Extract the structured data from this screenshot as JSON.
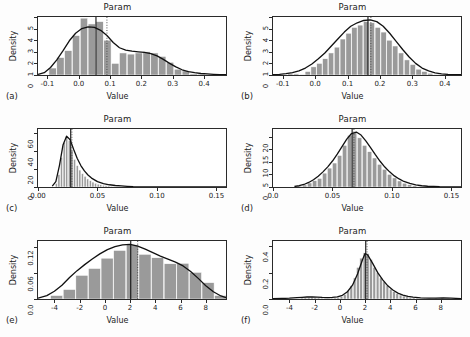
{
  "figure": {
    "axis_label_x": "Value",
    "axis_label_y": "Density",
    "title": "Param",
    "background": "#fdfdfd",
    "bar_fill": "#9a9a9a",
    "bar_edge": "#ffffff",
    "curve_color": "#111111",
    "rug_color": "#8a8a8a"
  },
  "chart_data": [
    {
      "type": "bar",
      "panel": "(a)",
      "title": "Param",
      "xlabel": "Value",
      "ylabel": "Density",
      "xlim": [
        -0.13,
        0.47
      ],
      "ylim": [
        0,
        5
      ],
      "xticks": [
        -0.1,
        0.0,
        0.1,
        0.2,
        0.3,
        0.4
      ],
      "xticklabels": [
        "-0.1",
        "0.0",
        "0.1",
        "0.2",
        "0.3",
        "0.4"
      ],
      "yticks": [
        0,
        1,
        2,
        3,
        4,
        5
      ],
      "yticklabels": [
        "0",
        "1",
        "2",
        "3",
        "4",
        "5"
      ],
      "bin_width": 0.025,
      "bin_starts": [
        -0.095,
        -0.07,
        -0.045,
        -0.02,
        0.005,
        0.03,
        0.055,
        0.08,
        0.105,
        0.13,
        0.155,
        0.18,
        0.205,
        0.23,
        0.255,
        0.28,
        0.305,
        0.33,
        0.355,
        0.38,
        0.405,
        0.43
      ],
      "values": [
        0.6,
        1.5,
        2.1,
        3.4,
        4.9,
        4.4,
        4.6,
        3.0,
        1.0,
        1.9,
        1.8,
        1.9,
        2.0,
        1.9,
        1.6,
        1.1,
        0.5,
        0.35,
        0.1,
        0.08,
        0.05,
        0.03
      ],
      "curve_x": [
        -0.13,
        -0.11,
        -0.09,
        -0.07,
        -0.05,
        -0.03,
        -0.01,
        0.01,
        0.03,
        0.05,
        0.07,
        0.09,
        0.11,
        0.13,
        0.15,
        0.17,
        0.19,
        0.21,
        0.23,
        0.25,
        0.27,
        0.29,
        0.31,
        0.33,
        0.35,
        0.37,
        0.39,
        0.41,
        0.43,
        0.45,
        0.47
      ],
      "curve_y": [
        0.05,
        0.2,
        0.65,
        1.3,
        2.1,
        2.95,
        3.6,
        4.0,
        4.15,
        4.1,
        3.85,
        3.4,
        2.8,
        2.35,
        2.15,
        2.05,
        2.0,
        1.95,
        1.85,
        1.65,
        1.35,
        1.0,
        0.7,
        0.45,
        0.3,
        0.2,
        0.13,
        0.09,
        0.06,
        0.04,
        0.03
      ],
      "median_line": 0.055,
      "mean_line": 0.09,
      "grid": false,
      "legend": "none"
    },
    {
      "type": "bar",
      "panel": "(b)",
      "title": "Param",
      "xlabel": "Value",
      "ylabel": "Density",
      "xlim": [
        -0.13,
        0.45
      ],
      "ylim": [
        0,
        5
      ],
      "xticks": [
        -0.1,
        0.0,
        0.1,
        0.2,
        0.3,
        0.4
      ],
      "xticklabels": [
        "-0.1",
        "0.0",
        "0.1",
        "0.2",
        "0.3",
        "0.4"
      ],
      "yticks": [
        0,
        1,
        2,
        3,
        4,
        5
      ],
      "yticklabels": [
        "0",
        "1",
        "2",
        "3",
        "4",
        "5"
      ],
      "bin_width": 0.018,
      "bin_starts": [
        -0.085,
        -0.067,
        -0.049,
        -0.031,
        -0.013,
        0.005,
        0.023,
        0.041,
        0.059,
        0.077,
        0.095,
        0.113,
        0.131,
        0.149,
        0.167,
        0.185,
        0.203,
        0.221,
        0.239,
        0.257,
        0.275,
        0.293,
        0.311,
        0.329,
        0.347,
        0.365
      ],
      "values": [
        0.15,
        0.1,
        0.05,
        0.3,
        0.7,
        1.0,
        1.4,
        1.9,
        2.4,
        3.1,
        3.6,
        4.1,
        4.3,
        4.6,
        4.5,
        4.1,
        3.7,
        3.0,
        2.5,
        1.9,
        1.3,
        0.9,
        0.5,
        0.3,
        0.15,
        0.05
      ],
      "curve_x": [
        -0.13,
        -0.11,
        -0.09,
        -0.07,
        -0.05,
        -0.03,
        -0.01,
        0.01,
        0.03,
        0.05,
        0.07,
        0.09,
        0.11,
        0.13,
        0.15,
        0.17,
        0.19,
        0.21,
        0.23,
        0.25,
        0.27,
        0.29,
        0.31,
        0.33,
        0.35,
        0.37,
        0.39,
        0.41,
        0.43,
        0.45
      ],
      "curve_y": [
        0.03,
        0.06,
        0.12,
        0.2,
        0.35,
        0.6,
        0.95,
        1.4,
        1.9,
        2.5,
        3.1,
        3.7,
        4.2,
        4.5,
        4.7,
        4.75,
        4.6,
        4.2,
        3.6,
        2.9,
        2.2,
        1.55,
        1.0,
        0.6,
        0.35,
        0.18,
        0.1,
        0.05,
        0.03,
        0.02
      ],
      "median_line": 0.163,
      "mean_line": 0.172,
      "grid": false,
      "legend": "none"
    },
    {
      "type": "bar",
      "panel": "(c)",
      "title": "Param",
      "xlabel": "Value",
      "ylabel": "Density",
      "xlim": [
        0.0,
        0.158
      ],
      "ylim": [
        0,
        65
      ],
      "xticks": [
        0.0,
        0.05,
        0.1,
        0.15
      ],
      "xticklabels": [
        "0.00",
        "0.05",
        "0.10",
        "0.15"
      ],
      "yticks": [
        0,
        20,
        40,
        60
      ],
      "yticklabels": [
        "0",
        "20",
        "40",
        "60"
      ],
      "bin_width": 0.0022,
      "bin_starts": [
        0.0145,
        0.0167,
        0.0189,
        0.0211,
        0.0233,
        0.0255,
        0.0277,
        0.0299,
        0.0321,
        0.0343,
        0.0365,
        0.0387,
        0.0409,
        0.0431,
        0.0453,
        0.0475,
        0.0497,
        0.0519,
        0.0541,
        0.0563,
        0.0585,
        0.0607,
        0.0629,
        0.0651,
        0.0673,
        0.0695,
        0.0717
      ],
      "values": [
        4,
        14,
        33,
        50,
        57,
        52,
        41,
        31,
        24,
        19,
        15,
        12,
        9,
        7,
        5.5,
        4.2,
        3.2,
        2.5,
        2,
        1.6,
        1.2,
        0.9,
        0.7,
        0.5,
        0.4,
        0.3,
        0.2
      ],
      "curve_x": [
        0.012,
        0.015,
        0.018,
        0.021,
        0.024,
        0.027,
        0.03,
        0.033,
        0.036,
        0.039,
        0.042,
        0.045,
        0.05,
        0.055,
        0.06,
        0.065,
        0.07,
        0.075,
        0.08,
        0.09,
        0.1,
        0.12,
        0.14,
        0.158
      ],
      "curve_y": [
        1,
        6,
        24,
        47,
        57,
        53,
        42,
        32,
        24,
        18,
        13.5,
        10,
        6,
        3.8,
        2.5,
        1.7,
        1.2,
        0.8,
        0.5,
        0.25,
        0.12,
        0.04,
        0.02,
        0.01
      ],
      "median_line": 0.0275,
      "mean_line": 0.0285,
      "grid": false,
      "legend": "none"
    },
    {
      "type": "bar",
      "panel": "(d)",
      "title": "Param",
      "xlabel": "Value",
      "ylabel": "Density",
      "xlim": [
        0.0,
        0.158
      ],
      "ylim": [
        0,
        23
      ],
      "xticks": [
        0.0,
        0.05,
        0.1,
        0.15
      ],
      "xticklabels": [
        "0.0",
        "0.05",
        "0.10",
        "0.15"
      ],
      "yticks": [
        0,
        5,
        10,
        15,
        20
      ],
      "yticklabels": [
        "0",
        "5",
        "10",
        "15",
        "20"
      ],
      "bin_width": 0.0042,
      "bin_starts": [
        0.0205,
        0.0247,
        0.0289,
        0.0331,
        0.0373,
        0.0415,
        0.0457,
        0.0499,
        0.0541,
        0.0583,
        0.0625,
        0.0667,
        0.0709,
        0.0751,
        0.0793,
        0.0835,
        0.0877,
        0.0919,
        0.0961,
        0.1003,
        0.1045,
        0.1087,
        0.1129,
        0.1171,
        0.1213,
        0.1255
      ],
      "values": [
        0.4,
        0.8,
        1.6,
        2.5,
        3.4,
        5.5,
        7.5,
        9.5,
        12.5,
        16.5,
        20.5,
        21.5,
        19.5,
        16.5,
        14.0,
        11.5,
        9.0,
        7.0,
        5.0,
        3.6,
        2.4,
        1.5,
        0.9,
        0.5,
        0.3,
        0.15
      ],
      "curve_x": [
        0.018,
        0.022,
        0.026,
        0.03,
        0.034,
        0.038,
        0.042,
        0.046,
        0.05,
        0.054,
        0.058,
        0.062,
        0.066,
        0.07,
        0.074,
        0.078,
        0.082,
        0.086,
        0.09,
        0.094,
        0.098,
        0.102,
        0.106,
        0.11,
        0.115,
        0.12,
        0.125,
        0.13,
        0.14,
        0.158
      ],
      "curve_y": [
        0.2,
        0.5,
        1.0,
        1.8,
        2.9,
        4.3,
        6.0,
        8.0,
        10.3,
        13.0,
        16.0,
        19.0,
        21.2,
        21.8,
        20.6,
        18.3,
        15.6,
        12.8,
        10.2,
        7.9,
        6.0,
        4.4,
        3.2,
        2.2,
        1.4,
        0.85,
        0.5,
        0.3,
        0.12,
        0.04
      ],
      "median_line": 0.0665,
      "mean_line": 0.068,
      "grid": false,
      "legend": "none"
    },
    {
      "type": "bar",
      "panel": "(e)",
      "title": "Param",
      "xlabel": "Value",
      "ylabel": "Density",
      "xlim": [
        -5.3,
        9.6
      ],
      "ylim": [
        0,
        0.135
      ],
      "xticks": [
        -4,
        -2,
        0,
        2,
        4,
        6,
        8
      ],
      "xticklabels": [
        "-4",
        "-2",
        "0",
        "2",
        "4",
        "6",
        "8"
      ],
      "yticks": [
        0.0,
        0.06,
        0.12
      ],
      "yticklabels": [
        "0.0",
        "0.06",
        "0.12"
      ],
      "bin_width": 1.0,
      "bin_starts": [
        -4.3,
        -3.3,
        -2.3,
        -1.3,
        -0.3,
        0.7,
        1.7,
        2.7,
        3.7,
        4.7,
        5.7,
        6.7,
        7.7,
        8.7
      ],
      "values": [
        0.008,
        0.022,
        0.055,
        0.071,
        0.095,
        0.113,
        0.126,
        0.104,
        0.096,
        0.082,
        0.083,
        0.062,
        0.038,
        0.008
      ],
      "curve_x": [
        -5.3,
        -4.6,
        -4.0,
        -3.4,
        -2.8,
        -2.2,
        -1.6,
        -1.0,
        -0.4,
        0.2,
        0.8,
        1.4,
        2.0,
        2.6,
        3.2,
        3.8,
        4.4,
        5.0,
        5.6,
        6.2,
        6.8,
        7.4,
        8.0,
        8.6,
        9.2,
        9.6
      ],
      "curve_y": [
        0.002,
        0.008,
        0.018,
        0.032,
        0.05,
        0.066,
        0.08,
        0.093,
        0.105,
        0.115,
        0.122,
        0.126,
        0.127,
        0.123,
        0.116,
        0.108,
        0.1,
        0.093,
        0.086,
        0.077,
        0.064,
        0.048,
        0.031,
        0.017,
        0.007,
        0.003
      ],
      "median_line": 2.05,
      "mean_line": 2.6,
      "grid": false,
      "legend": "none"
    },
    {
      "type": "bar",
      "panel": "(f)",
      "title": "Param",
      "xlabel": "Value",
      "ylabel": "Density",
      "xlim": [
        -5.3,
        9.6
      ],
      "ylim": [
        0,
        0.44
      ],
      "xticks": [
        -4,
        -2,
        0,
        2,
        4,
        6,
        8
      ],
      "xticklabels": [
        "-4",
        "-2",
        "0",
        "2",
        "4",
        "6",
        "8"
      ],
      "yticks": [
        0.0,
        0.2,
        0.4
      ],
      "yticklabels": [
        "0.0",
        "0.2",
        "0.4"
      ],
      "bin_width": 0.26,
      "bin_starts": [
        -3.1,
        -2.84,
        -2.58,
        -2.32,
        -2.06,
        -1.8,
        -1.54,
        -1.28,
        -1.02,
        -0.76,
        -0.5,
        -0.24,
        0.02,
        0.28,
        0.54,
        0.8,
        1.06,
        1.32,
        1.58,
        1.84,
        2.1,
        2.36,
        2.62,
        2.88,
        3.14,
        3.4,
        3.66,
        3.92,
        4.18,
        4.44,
        4.7,
        4.96,
        5.22,
        5.48,
        5.74,
        6.0,
        6.5,
        7.0,
        7.5,
        8.0,
        8.5
      ],
      "values": [
        0.008,
        0.01,
        0.012,
        0.014,
        0.012,
        0.009,
        0.007,
        0.006,
        0.006,
        0.007,
        0.008,
        0.012,
        0.02,
        0.035,
        0.06,
        0.1,
        0.16,
        0.24,
        0.31,
        0.35,
        0.345,
        0.3,
        0.24,
        0.2,
        0.16,
        0.13,
        0.1,
        0.075,
        0.055,
        0.04,
        0.03,
        0.022,
        0.016,
        0.012,
        0.009,
        0.007,
        0.005,
        0.006,
        0.007,
        0.008,
        0.006
      ],
      "curve_x": [
        -5.3,
        -4.6,
        -4.0,
        -3.4,
        -3.0,
        -2.6,
        -2.2,
        -1.8,
        -1.4,
        -1.0,
        -0.6,
        -0.2,
        0.2,
        0.6,
        1.0,
        1.4,
        1.8,
        2.0,
        2.2,
        2.6,
        3.0,
        3.4,
        3.8,
        4.2,
        4.6,
        5.0,
        5.4,
        5.8,
        6.4,
        7.0,
        7.6,
        8.2,
        8.8,
        9.2,
        9.6
      ],
      "curve_y": [
        0.002,
        0.004,
        0.006,
        0.01,
        0.013,
        0.015,
        0.016,
        0.014,
        0.012,
        0.011,
        0.012,
        0.016,
        0.028,
        0.055,
        0.105,
        0.19,
        0.3,
        0.345,
        0.335,
        0.27,
        0.2,
        0.145,
        0.1,
        0.068,
        0.045,
        0.03,
        0.02,
        0.014,
        0.009,
        0.007,
        0.007,
        0.008,
        0.007,
        0.005,
        0.003
      ],
      "median_line": 2.05,
      "mean_line": 2.15,
      "grid": false,
      "legend": "none"
    }
  ]
}
